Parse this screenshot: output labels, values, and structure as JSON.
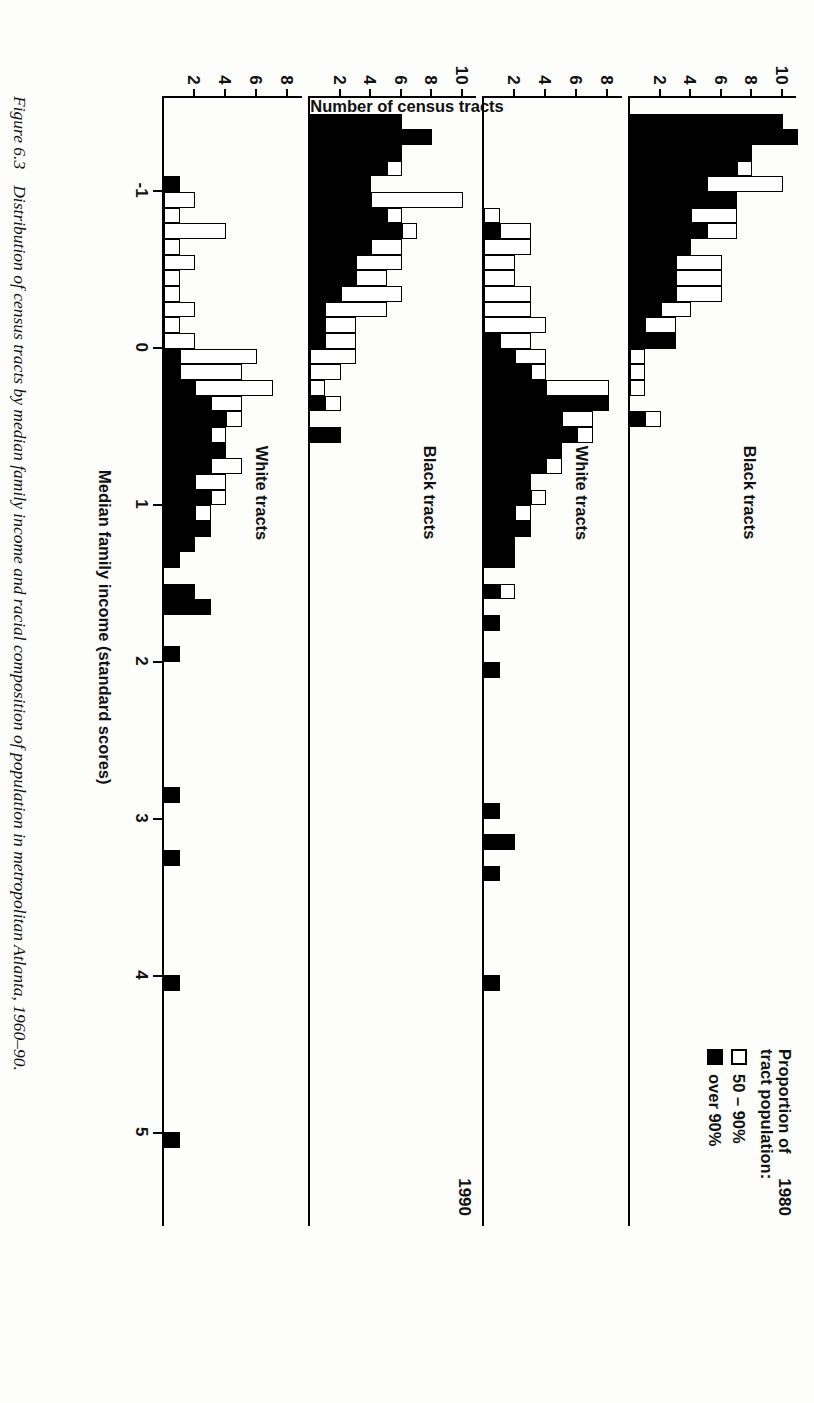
{
  "figure": {
    "number": "Figure 6.3",
    "caption": "Distribution of census tracts by median family income and racial composition of population in metropolitan Atlanta, 1960–90."
  },
  "axis": {
    "x_title": "Median family income (standard scores)",
    "y_title": "Number of census tracts",
    "x_ticks": [
      "-1",
      "0",
      "1",
      "2",
      "3",
      "4",
      "5"
    ]
  },
  "legend": {
    "title_line1": "Proportion of",
    "title_line2": "tract population:",
    "items": [
      {
        "label": "50 – 90%",
        "style": "open"
      },
      {
        "label": "over 90%",
        "style": "filled"
      }
    ]
  },
  "panels": [
    {
      "year": "1980",
      "group": "Black tracts",
      "y_ticks": [
        "2",
        "4",
        "6",
        "8",
        "10"
      ],
      "ymax": 11
    },
    {
      "year": "",
      "group": "White tracts",
      "y_ticks": [
        "2",
        "4",
        "6",
        "8"
      ],
      "ymax": 9
    },
    {
      "year": "1990",
      "group": "Black tracts",
      "y_ticks": [
        "2",
        "4",
        "6",
        "8",
        "10"
      ],
      "ymax": 11
    },
    {
      "year": "",
      "group": "White tracts",
      "y_ticks": [
        "2",
        "4",
        "6",
        "8"
      ],
      "ymax": 9
    }
  ],
  "colors": {
    "ink": "#000000",
    "paper": "#fdfdfb",
    "fill_over90": "#000000",
    "fill_50_90": "#ffffff"
  },
  "chart_data": {
    "type": "bar",
    "title": "Distribution of census tracts by median family income and racial composition of population in metropolitan Atlanta, 1960–90.",
    "xlabel": "Median family income (standard scores)",
    "ylabel": "Number of census tracts",
    "xlim": [
      -1.6,
      5.6
    ],
    "bin_width": 0.1,
    "grid": false,
    "legend_position": "top-right",
    "stacked": true,
    "series_names": [
      "50 – 90%",
      "over 90%"
    ],
    "panels": [
      {
        "year": "1980",
        "group": "Black tracts",
        "ylim": [
          0,
          11
        ],
        "yticks": [
          2,
          4,
          6,
          8,
          10
        ],
        "bins": [
          {
            "x": -1.5,
            "over90": 10,
            "p50_90": 0
          },
          {
            "x": -1.4,
            "over90": 11,
            "p50_90": 0
          },
          {
            "x": -1.3,
            "over90": 8,
            "p50_90": 0
          },
          {
            "x": -1.2,
            "over90": 7,
            "p50_90": 1
          },
          {
            "x": -1.1,
            "over90": 5,
            "p50_90": 5
          },
          {
            "x": -1.0,
            "over90": 7,
            "p50_90": 0
          },
          {
            "x": -0.9,
            "over90": 4,
            "p50_90": 3
          },
          {
            "x": -0.8,
            "over90": 5,
            "p50_90": 2
          },
          {
            "x": -0.7,
            "over90": 4,
            "p50_90": 0
          },
          {
            "x": -0.6,
            "over90": 3,
            "p50_90": 3
          },
          {
            "x": -0.5,
            "over90": 3,
            "p50_90": 3
          },
          {
            "x": -0.4,
            "over90": 3,
            "p50_90": 3
          },
          {
            "x": -0.3,
            "over90": 2,
            "p50_90": 2
          },
          {
            "x": -0.2,
            "over90": 1,
            "p50_90": 2
          },
          {
            "x": -0.1,
            "over90": 3,
            "p50_90": 0
          },
          {
            "x": 0.0,
            "over90": 0,
            "p50_90": 1
          },
          {
            "x": 0.1,
            "over90": 0,
            "p50_90": 1
          },
          {
            "x": 0.2,
            "over90": 0,
            "p50_90": 1
          },
          {
            "x": 0.4,
            "over90": 1,
            "p50_90": 1
          }
        ]
      },
      {
        "year": "1980",
        "group": "White tracts",
        "ylim": [
          0,
          9
        ],
        "yticks": [
          2,
          4,
          6,
          8
        ],
        "bins": [
          {
            "x": -0.9,
            "over90": 0,
            "p50_90": 1
          },
          {
            "x": -0.8,
            "over90": 1,
            "p50_90": 2
          },
          {
            "x": -0.7,
            "over90": 0,
            "p50_90": 3
          },
          {
            "x": -0.6,
            "over90": 0,
            "p50_90": 2
          },
          {
            "x": -0.5,
            "over90": 0,
            "p50_90": 2
          },
          {
            "x": -0.4,
            "over90": 0,
            "p50_90": 3
          },
          {
            "x": -0.3,
            "over90": 0,
            "p50_90": 3
          },
          {
            "x": -0.2,
            "over90": 0,
            "p50_90": 4
          },
          {
            "x": -0.1,
            "over90": 1,
            "p50_90": 2
          },
          {
            "x": 0.0,
            "over90": 2,
            "p50_90": 2
          },
          {
            "x": 0.1,
            "over90": 3,
            "p50_90": 1
          },
          {
            "x": 0.2,
            "over90": 4,
            "p50_90": 4
          },
          {
            "x": 0.3,
            "over90": 8,
            "p50_90": 0
          },
          {
            "x": 0.4,
            "over90": 5,
            "p50_90": 2
          },
          {
            "x": 0.5,
            "over90": 6,
            "p50_90": 1
          },
          {
            "x": 0.6,
            "over90": 5,
            "p50_90": 0
          },
          {
            "x": 0.7,
            "over90": 4,
            "p50_90": 1
          },
          {
            "x": 0.8,
            "over90": 3,
            "p50_90": 0
          },
          {
            "x": 0.9,
            "over90": 3,
            "p50_90": 1
          },
          {
            "x": 1.0,
            "over90": 2,
            "p50_90": 1
          },
          {
            "x": 1.1,
            "over90": 3,
            "p50_90": 0
          },
          {
            "x": 1.2,
            "over90": 2,
            "p50_90": 0
          },
          {
            "x": 1.3,
            "over90": 2,
            "p50_90": 0
          },
          {
            "x": 1.5,
            "over90": 1,
            "p50_90": 1
          },
          {
            "x": 1.7,
            "over90": 1,
            "p50_90": 0
          },
          {
            "x": 2.0,
            "over90": 1,
            "p50_90": 0
          },
          {
            "x": 2.9,
            "over90": 1,
            "p50_90": 0
          },
          {
            "x": 3.1,
            "over90": 2,
            "p50_90": 0
          },
          {
            "x": 3.3,
            "over90": 1,
            "p50_90": 0
          },
          {
            "x": 4.0,
            "over90": 1,
            "p50_90": 0
          }
        ]
      },
      {
        "year": "1990",
        "group": "Black tracts",
        "ylim": [
          0,
          11
        ],
        "yticks": [
          2,
          4,
          6,
          8,
          10
        ],
        "bins": [
          {
            "x": -1.5,
            "over90": 6,
            "p50_90": 0
          },
          {
            "x": -1.4,
            "over90": 8,
            "p50_90": 0
          },
          {
            "x": -1.3,
            "over90": 6,
            "p50_90": 0
          },
          {
            "x": -1.2,
            "over90": 5,
            "p50_90": 1
          },
          {
            "x": -1.1,
            "over90": 4,
            "p50_90": 0
          },
          {
            "x": -1.0,
            "over90": 4,
            "p50_90": 6
          },
          {
            "x": -0.9,
            "over90": 5,
            "p50_90": 1
          },
          {
            "x": -0.8,
            "over90": 6,
            "p50_90": 1
          },
          {
            "x": -0.7,
            "over90": 4,
            "p50_90": 2
          },
          {
            "x": -0.6,
            "over90": 3,
            "p50_90": 3
          },
          {
            "x": -0.5,
            "over90": 3,
            "p50_90": 2
          },
          {
            "x": -0.4,
            "over90": 2,
            "p50_90": 4
          },
          {
            "x": -0.3,
            "over90": 1,
            "p50_90": 4
          },
          {
            "x": -0.2,
            "over90": 1,
            "p50_90": 2
          },
          {
            "x": -0.1,
            "over90": 1,
            "p50_90": 2
          },
          {
            "x": 0.0,
            "over90": 0,
            "p50_90": 3
          },
          {
            "x": 0.1,
            "over90": 0,
            "p50_90": 2
          },
          {
            "x": 0.2,
            "over90": 0,
            "p50_90": 1
          },
          {
            "x": 0.3,
            "over90": 1,
            "p50_90": 1
          },
          {
            "x": 0.5,
            "over90": 2,
            "p50_90": 0
          }
        ]
      },
      {
        "year": "1990",
        "group": "White tracts",
        "ylim": [
          0,
          9
        ],
        "yticks": [
          2,
          4,
          6,
          8
        ],
        "bins": [
          {
            "x": -1.1,
            "over90": 1,
            "p50_90": 0
          },
          {
            "x": -1.0,
            "over90": 0,
            "p50_90": 2
          },
          {
            "x": -0.9,
            "over90": 0,
            "p50_90": 1
          },
          {
            "x": -0.8,
            "over90": 0,
            "p50_90": 4
          },
          {
            "x": -0.7,
            "over90": 0,
            "p50_90": 1
          },
          {
            "x": -0.6,
            "over90": 0,
            "p50_90": 2
          },
          {
            "x": -0.5,
            "over90": 0,
            "p50_90": 1
          },
          {
            "x": -0.4,
            "over90": 0,
            "p50_90": 1
          },
          {
            "x": -0.3,
            "over90": 0,
            "p50_90": 2
          },
          {
            "x": -0.2,
            "over90": 0,
            "p50_90": 1
          },
          {
            "x": -0.1,
            "over90": 0,
            "p50_90": 2
          },
          {
            "x": 0.0,
            "over90": 1,
            "p50_90": 5
          },
          {
            "x": 0.1,
            "over90": 1,
            "p50_90": 4
          },
          {
            "x": 0.2,
            "over90": 2,
            "p50_90": 5
          },
          {
            "x": 0.3,
            "over90": 3,
            "p50_90": 2
          },
          {
            "x": 0.4,
            "over90": 4,
            "p50_90": 1
          },
          {
            "x": 0.5,
            "over90": 3,
            "p50_90": 1
          },
          {
            "x": 0.6,
            "over90": 4,
            "p50_90": 0
          },
          {
            "x": 0.7,
            "over90": 3,
            "p50_90": 2
          },
          {
            "x": 0.8,
            "over90": 2,
            "p50_90": 2
          },
          {
            "x": 0.9,
            "over90": 3,
            "p50_90": 1
          },
          {
            "x": 1.0,
            "over90": 2,
            "p50_90": 1
          },
          {
            "x": 1.1,
            "over90": 3,
            "p50_90": 0
          },
          {
            "x": 1.2,
            "over90": 2,
            "p50_90": 0
          },
          {
            "x": 1.3,
            "over90": 1,
            "p50_90": 0
          },
          {
            "x": 1.5,
            "over90": 2,
            "p50_90": 0
          },
          {
            "x": 1.6,
            "over90": 3,
            "p50_90": 0
          },
          {
            "x": 1.9,
            "over90": 1,
            "p50_90": 0
          },
          {
            "x": 2.8,
            "over90": 1,
            "p50_90": 0
          },
          {
            "x": 3.2,
            "over90": 1,
            "p50_90": 0
          },
          {
            "x": 4.0,
            "over90": 1,
            "p50_90": 0
          },
          {
            "x": 5.0,
            "over90": 1,
            "p50_90": 0
          }
        ]
      }
    ]
  }
}
